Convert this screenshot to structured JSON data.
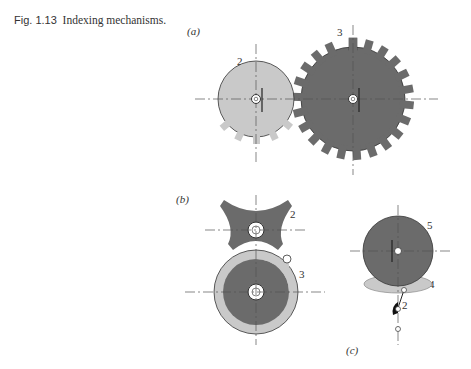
{
  "figure": {
    "number": "Fig. 1.13",
    "title": "Indexing mechanisms."
  },
  "panels": [
    {
      "id": "a",
      "label": "(a)",
      "parts": [
        "2",
        "3"
      ],
      "description": "External spur gear pair: small gear 2 (light gray) with partial teeth meshing with large gear 3 (dark gray)"
    },
    {
      "id": "b",
      "label": "(b)",
      "parts": [
        "2",
        "3"
      ],
      "description": "Geneva mechanism: four-slot star wheel 2 and driving crank disk 3 with pin"
    },
    {
      "id": "c",
      "label": "(c)",
      "parts": [
        "2",
        "3",
        "4",
        "5"
      ],
      "description": "Ratchet-type indexing: wheel 5, pawl 4, link 3, driver 2"
    }
  ],
  "colors": {
    "dark": "#6b6b6b",
    "light": "#c9c9c9",
    "line": "#333333",
    "bg": "#ffffff"
  }
}
